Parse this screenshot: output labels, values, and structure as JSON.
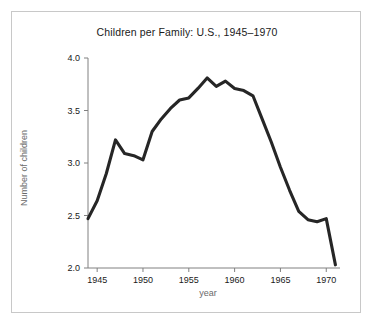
{
  "figure": {
    "background_color": "#ffffff",
    "frame_color": "#c8c8c8",
    "line_color": "#262626"
  },
  "chart_data": {
    "type": "line",
    "title": "Children per Family: U.S., 1945–1970",
    "xlabel": "year",
    "ylabel": "Number of children",
    "xlim": [
      1944,
      1971.5
    ],
    "ylim": [
      2.0,
      4.0
    ],
    "grid": false,
    "legend": null,
    "xticks": [
      1945,
      1950,
      1955,
      1960,
      1965,
      1970
    ],
    "xtick_labels": [
      "1945",
      "1950",
      "1955",
      "1960",
      "1965",
      "1970"
    ],
    "yticks": [
      2.0,
      2.5,
      3.0,
      3.5,
      4.0
    ],
    "ytick_labels": [
      "2.0",
      "2.5",
      "3.0",
      "3.5",
      "4.0"
    ],
    "x": [
      1944,
      1945,
      1946,
      1947,
      1948,
      1949,
      1950,
      1951,
      1952,
      1953,
      1954,
      1955,
      1956,
      1957,
      1958,
      1959,
      1960,
      1961,
      1962,
      1963,
      1964,
      1965,
      1966,
      1967,
      1968,
      1969,
      1970,
      1971
    ],
    "values": [
      2.47,
      2.64,
      2.9,
      3.22,
      3.09,
      3.07,
      3.03,
      3.3,
      3.42,
      3.52,
      3.6,
      3.62,
      3.71,
      3.81,
      3.73,
      3.78,
      3.71,
      3.69,
      3.64,
      3.42,
      3.2,
      2.96,
      2.74,
      2.54,
      2.46,
      2.44,
      2.47,
      2.03
    ],
    "series": [
      {
        "name": "Children per family",
        "values": [
          2.47,
          2.64,
          2.9,
          3.22,
          3.09,
          3.07,
          3.03,
          3.3,
          3.42,
          3.52,
          3.6,
          3.62,
          3.71,
          3.81,
          3.73,
          3.78,
          3.71,
          3.69,
          3.64,
          3.42,
          3.2,
          2.96,
          2.74,
          2.54,
          2.46,
          2.44,
          2.47,
          2.03
        ]
      }
    ]
  }
}
